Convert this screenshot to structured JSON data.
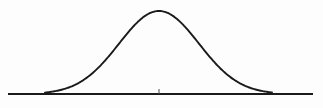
{
  "figure": {
    "title": "",
    "background_color": "#fdfdfd",
    "width": 323,
    "height": 108,
    "alt_text": "Normal distribution bell curve above a horizontal baseline with a center tick mark"
  },
  "chart_data": {
    "type": "line",
    "title": "",
    "subtitle": "",
    "xlabel": "",
    "ylabel": "",
    "legend": [],
    "legend_position": "none",
    "grid": false,
    "annotations": [],
    "axis": {
      "baseline_y_px": 94,
      "baseline_x_start_px": 8,
      "baseline_x_end_px": 313,
      "center_tick_x_px": 159,
      "center_tick_height_px": 5,
      "tick_labels": [],
      "axis_color": "#1a1a1a"
    },
    "curve": {
      "name": "gaussian",
      "distribution": "normal",
      "mean_px": 159,
      "peak_y_px": 11,
      "sigma_px": 40,
      "x_start_px": 45,
      "x_end_px": 272,
      "stroke_color": "#1a1a1a",
      "stroke_width": 1.9,
      "x": [
        45,
        57,
        69,
        81,
        93,
        105,
        117,
        129,
        141,
        153,
        159,
        165,
        177,
        189,
        201,
        213,
        225,
        237,
        249,
        261,
        272
      ],
      "y": [
        91.2,
        90.0,
        87.9,
        84.3,
        78.6,
        70.5,
        60.0,
        47.9,
        35.9,
        25.9,
        22.5,
        25.9,
        35.9,
        47.9,
        60.0,
        70.5,
        78.6,
        84.3,
        87.9,
        90.0,
        91.2
      ]
    },
    "xlim": [
      0,
      323
    ],
    "ylim": [
      108,
      0
    ]
  }
}
